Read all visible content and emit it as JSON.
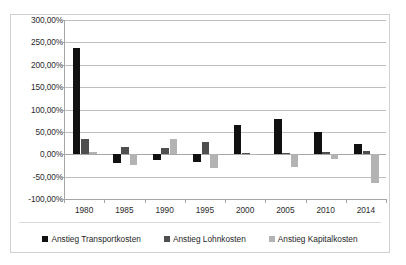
{
  "chart_data": {
    "type": "bar",
    "title": "",
    "subtitle": "",
    "xlabel": "",
    "ylabel": "",
    "grid": true,
    "legend_position": "bottom",
    "ylim": [
      -100,
      300
    ],
    "ytick_step": 50,
    "ytick_labels": [
      "300,00%",
      "250,00%",
      "200,00%",
      "150,00%",
      "100,00%",
      "50,00%",
      "0,00%",
      "-50,00%",
      "-100,00%"
    ],
    "ytick_values": [
      300,
      250,
      200,
      150,
      100,
      50,
      0,
      -50,
      -100
    ],
    "categories": [
      "1980",
      "1985",
      "1990",
      "1995",
      "2000",
      "2005",
      "2010",
      "2014"
    ],
    "series": [
      {
        "name": "Anstieg Transportkosten",
        "color": "#111111",
        "values": [
          237,
          -20,
          -13,
          -18,
          65,
          78,
          50,
          22
        ]
      },
      {
        "name": "Anstieg Lohnkosten",
        "color": "#4f4f4f",
        "values": [
          35,
          16,
          15,
          27,
          2,
          3,
          4,
          8
        ]
      },
      {
        "name": "Anstieg Kapitalkosten",
        "color": "#b3b3b3",
        "values": [
          5,
          -25,
          35,
          -30,
          -2,
          -28,
          -10,
          -65
        ]
      }
    ]
  },
  "legend": {
    "items": [
      {
        "label": "Anstieg Transportkosten",
        "color": "#111111"
      },
      {
        "label": "Anstieg Lohnkosten",
        "color": "#4f4f4f"
      },
      {
        "label": "Anstieg Kapitalkosten",
        "color": "#b3b3b3"
      }
    ]
  },
  "colors": {
    "series_transport": "#111111",
    "series_lohn": "#4f4f4f",
    "series_kapital": "#b3b3b3",
    "gridline": "#bfbfbf",
    "axis": "#a6a6a6",
    "border": "#d0d0d0",
    "text": "#2b2b2b",
    "background": "#ffffff"
  }
}
